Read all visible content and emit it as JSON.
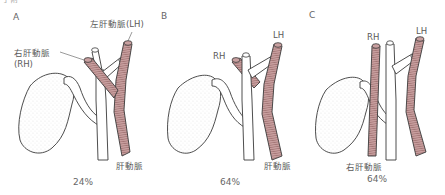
{
  "header": {
    "cut_text": "手術"
  },
  "colors": {
    "artery_fill": "#c9a0a0",
    "artery_hatch": "#8a5a5a",
    "outline": "#3a3a3a",
    "duct_fill": "#ffffff",
    "label": "#5a5a5a"
  },
  "panels": [
    {
      "id": "A",
      "letter": "A",
      "percent": "24%",
      "labels": {
        "left_hepatic": "左肝動脈(LH)",
        "right_hepatic_line1": "右肝動脈",
        "right_hepatic_line2": "(RH)",
        "hepatic_artery": "肝動脈"
      },
      "variant": "right hepatic artery crosses anterior to common hepatic duct"
    },
    {
      "id": "B",
      "letter": "B",
      "percent": "64%",
      "labels": {
        "right_hepatic": "RH",
        "left_hepatic": "LH",
        "hepatic_artery": "肝動脈"
      },
      "variant": "right hepatic artery crosses posterior to common hepatic duct"
    },
    {
      "id": "C",
      "letter": "C",
      "percent": "64%",
      "labels": {
        "right_hepatic": "RH",
        "left_hepatic": "LH",
        "right_hepatic_bottom": "右肝動脈"
      },
      "variant": "right hepatic artery arises separately (replaced/accessory)"
    }
  ]
}
